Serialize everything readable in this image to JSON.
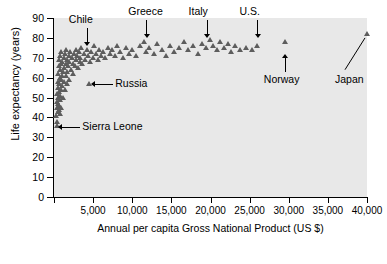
{
  "chart_data": {
    "type": "scatter",
    "title": "",
    "xlabel": "Annual per capita Gross National Product (US $)",
    "ylabel": "Life expectancy (years)",
    "xlim": [
      0,
      40000
    ],
    "ylim": [
      0,
      90
    ],
    "xticks": [
      0,
      5000,
      10000,
      15000,
      20000,
      25000,
      30000,
      35000,
      40000
    ],
    "xticklabels": [
      "0",
      "5,000",
      "10,000",
      "15,000",
      "20,000",
      "25,000",
      "30,000",
      "35,000",
      "40,000"
    ],
    "yticks": [
      0,
      10,
      20,
      30,
      40,
      50,
      60,
      70,
      80,
      90
    ],
    "yticklabels": [
      "0",
      "10",
      "20",
      "30",
      "40",
      "50",
      "60",
      "70",
      "80",
      "90"
    ],
    "grid": false,
    "legend": null,
    "marker": "triangle",
    "marker_color": "#5d5d5d",
    "plot_background": "#e8e8e8",
    "points": [
      [
        300,
        41
      ],
      [
        350,
        38
      ],
      [
        400,
        45
      ],
      [
        420,
        48
      ],
      [
        450,
        36
      ],
      [
        470,
        52
      ],
      [
        500,
        43
      ],
      [
        520,
        55
      ],
      [
        540,
        47
      ],
      [
        560,
        58
      ],
      [
        580,
        50
      ],
      [
        600,
        62
      ],
      [
        620,
        44
      ],
      [
        640,
        53
      ],
      [
        660,
        66
      ],
      [
        680,
        46
      ],
      [
        700,
        57
      ],
      [
        720,
        69
      ],
      [
        740,
        49
      ],
      [
        760,
        60
      ],
      [
        780,
        42
      ],
      [
        800,
        64
      ],
      [
        820,
        51
      ],
      [
        850,
        71
      ],
      [
        870,
        54
      ],
      [
        900,
        67
      ],
      [
        920,
        59
      ],
      [
        950,
        45
      ],
      [
        980,
        73
      ],
      [
        1000,
        61
      ],
      [
        1050,
        56
      ],
      [
        1100,
        68
      ],
      [
        1150,
        63
      ],
      [
        1200,
        50
      ],
      [
        1250,
        70
      ],
      [
        1300,
        58
      ],
      [
        1350,
        65
      ],
      [
        1400,
        72
      ],
      [
        1450,
        54
      ],
      [
        1500,
        67
      ],
      [
        1550,
        61
      ],
      [
        1600,
        74
      ],
      [
        1650,
        57
      ],
      [
        1700,
        69
      ],
      [
        1750,
        63
      ],
      [
        1800,
        66
      ],
      [
        1900,
        71
      ],
      [
        1950,
        59
      ],
      [
        2000,
        68
      ],
      [
        2100,
        73
      ],
      [
        2200,
        64
      ],
      [
        2300,
        70
      ],
      [
        2400,
        62
      ],
      [
        2500,
        67
      ],
      [
        2600,
        72
      ],
      [
        2700,
        66
      ],
      [
        2800,
        74
      ],
      [
        2900,
        69
      ],
      [
        3000,
        71
      ],
      [
        3100,
        65
      ],
      [
        3200,
        73
      ],
      [
        3300,
        68
      ],
      [
        3400,
        70
      ],
      [
        3500,
        75
      ],
      [
        3600,
        67
      ],
      [
        3800,
        72
      ],
      [
        4000,
        69
      ],
      [
        4200,
        74
      ],
      [
        4400,
        71
      ],
      [
        4500,
        57
      ],
      [
        4600,
        68
      ],
      [
        4800,
        73
      ],
      [
        5000,
        70
      ],
      [
        5200,
        76
      ],
      [
        5400,
        72
      ],
      [
        5600,
        69
      ],
      [
        5800,
        74
      ],
      [
        6000,
        71
      ],
      [
        6300,
        73
      ],
      [
        6600,
        70
      ],
      [
        6900,
        75
      ],
      [
        7200,
        72
      ],
      [
        7500,
        74
      ],
      [
        7800,
        71
      ],
      [
        8100,
        76
      ],
      [
        8500,
        73
      ],
      [
        8800,
        70
      ],
      [
        9200,
        75
      ],
      [
        9600,
        72
      ],
      [
        10000,
        74
      ],
      [
        10500,
        71
      ],
      [
        11000,
        76
      ],
      [
        11500,
        78
      ],
      [
        11800,
        73
      ],
      [
        12200,
        75
      ],
      [
        12800,
        72
      ],
      [
        13200,
        77
      ],
      [
        13800,
        74
      ],
      [
        14300,
        71
      ],
      [
        14900,
        76
      ],
      [
        15400,
        73
      ],
      [
        16000,
        75
      ],
      [
        16600,
        78
      ],
      [
        17200,
        74
      ],
      [
        17800,
        76
      ],
      [
        18400,
        72
      ],
      [
        19000,
        77
      ],
      [
        19500,
        75
      ],
      [
        20000,
        79
      ],
      [
        20400,
        76
      ],
      [
        20900,
        74
      ],
      [
        21300,
        78
      ],
      [
        21800,
        75
      ],
      [
        22200,
        77
      ],
      [
        22700,
        73
      ],
      [
        23200,
        76
      ],
      [
        23800,
        74
      ],
      [
        24500,
        75
      ],
      [
        25300,
        74
      ],
      [
        26000,
        76
      ],
      [
        29500,
        78
      ],
      [
        40000,
        82
      ]
    ],
    "annotations": [
      {
        "label": "Chile",
        "x": 4200,
        "y": 75,
        "style": "leader-down"
      },
      {
        "label": "Greece",
        "x": 11800,
        "y": 79,
        "style": "leader-down"
      },
      {
        "label": "Italy",
        "x": 19500,
        "y": 79,
        "style": "leader-down"
      },
      {
        "label": "U.S.",
        "x": 26000,
        "y": 79,
        "style": "leader-down"
      },
      {
        "label": "Russia",
        "x": 4500,
        "y": 57,
        "style": "leader-left"
      },
      {
        "label": "Sierra Leone",
        "x": 300,
        "y": 35,
        "style": "leader-left"
      },
      {
        "label": "Norway",
        "x": 29500,
        "y": 62,
        "style": "arrow-up"
      },
      {
        "label": "Japan",
        "x": 40000,
        "y": 62,
        "style": "arrow-diagonal"
      }
    ]
  }
}
